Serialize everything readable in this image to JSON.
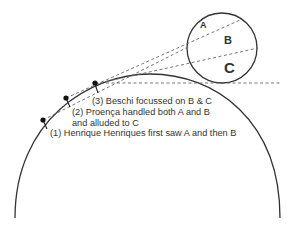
{
  "diagram": {
    "zones": [
      {
        "id": "A",
        "label": "A"
      },
      {
        "id": "B",
        "label": "B"
      },
      {
        "id": "C",
        "label": "C"
      }
    ],
    "observers": [
      {
        "id": 1,
        "label": "(1) Henrique Henriques first saw A and then B"
      },
      {
        "id": 2,
        "label_line1": "(2) Proença handled both A and B",
        "label_line2": "and alluded to C"
      },
      {
        "id": 3,
        "label": "(3) Beschi focussed on B & C"
      }
    ],
    "colors": {
      "stroke": "#333333",
      "dash": "#666666",
      "text": "#333333"
    }
  }
}
